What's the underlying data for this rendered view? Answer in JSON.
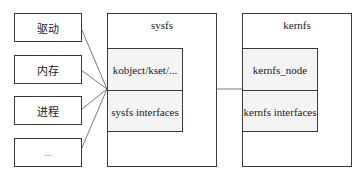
{
  "left_items": [
    {
      "label": "驱动"
    },
    {
      "label": "内存"
    },
    {
      "label": "进程"
    },
    {
      "label": "..."
    }
  ],
  "sysfs": {
    "title": "sysfs",
    "cells": [
      {
        "label": "kobject/kset/..."
      },
      {
        "label": "sysfs interfaces"
      }
    ]
  },
  "kernfs": {
    "title": "kernfs",
    "cells": [
      {
        "label": "kernfs_node"
      },
      {
        "label": "kernfs interfaces"
      }
    ]
  }
}
